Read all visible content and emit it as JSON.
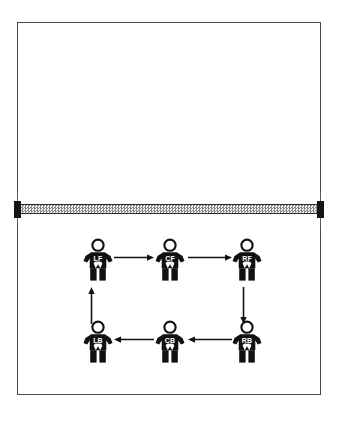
{
  "diagram": {
    "court": {
      "border_color": "#4a4a4a",
      "fill_color": "#ffffff"
    },
    "net": {
      "name": "net",
      "band_color": "#8a8a8a",
      "post_color": "#151515",
      "pole_color": "#5d5d5d"
    },
    "players": [
      {
        "id": "lf",
        "label": "LF",
        "position_name": "left-front",
        "row": "front",
        "column": "left",
        "x": 79,
        "y": 238
      },
      {
        "id": "cf",
        "label": "CF",
        "position_name": "center-front",
        "row": "front",
        "column": "center",
        "x": 151,
        "y": 238
      },
      {
        "id": "rf",
        "label": "RF",
        "position_name": "right-front",
        "row": "front",
        "column": "right",
        "x": 228,
        "y": 238
      },
      {
        "id": "rb",
        "label": "RB",
        "position_name": "right-back",
        "row": "back",
        "column": "right",
        "x": 228,
        "y": 320
      },
      {
        "id": "cb",
        "label": "CB",
        "position_name": "center-back",
        "row": "back",
        "column": "center",
        "x": 151,
        "y": 320
      },
      {
        "id": "lb",
        "label": "LB",
        "position_name": "left-back",
        "row": "back",
        "column": "left",
        "x": 79,
        "y": 320
      }
    ],
    "arrows": [
      {
        "id": "lf-to-cf",
        "from": "LF",
        "to": "CF",
        "direction": "right",
        "x": 114,
        "y": 254,
        "length": 40
      },
      {
        "id": "cf-to-rf",
        "from": "CF",
        "to": "RF",
        "direction": "right",
        "x": 188,
        "y": 254,
        "length": 44
      },
      {
        "id": "rf-to-rb",
        "from": "RF",
        "to": "RB",
        "direction": "down",
        "x": 240,
        "y": 287,
        "length": 37
      },
      {
        "id": "rb-to-cb",
        "from": "RB",
        "to": "CB",
        "direction": "left",
        "x": 188,
        "y": 336,
        "length": 44
      },
      {
        "id": "cb-to-lb",
        "from": "CB",
        "to": "LB",
        "direction": "left",
        "x": 114,
        "y": 336,
        "length": 40
      },
      {
        "id": "lb-to-lf",
        "from": "LB",
        "to": "LF",
        "direction": "up",
        "x": 88,
        "y": 287,
        "length": 37
      }
    ]
  }
}
